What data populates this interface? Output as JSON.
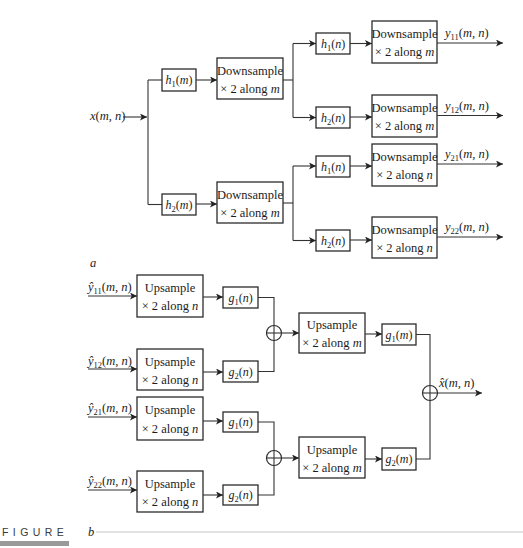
{
  "punct": {
    "open": "(",
    "close": ")"
  },
  "analysis": {
    "input": {
      "base": "x",
      "var": "m, n"
    },
    "row_filters": [
      {
        "base": "h",
        "sub": "1",
        "var": "m"
      },
      {
        "base": "h",
        "sub": "2",
        "var": "m"
      }
    ],
    "row_downsample": [
      {
        "line1": "Downsample",
        "line2": "× 2 along ",
        "var": "m"
      },
      {
        "line1": "Downsample",
        "line2": "× 2 along ",
        "var": "m"
      }
    ],
    "col_filters": [
      {
        "base": "h",
        "sub": "1",
        "var": "n"
      },
      {
        "base": "h",
        "sub": "2",
        "var": "n"
      },
      {
        "base": "h",
        "sub": "1",
        "var": "n"
      },
      {
        "base": "h",
        "sub": "2",
        "var": "n"
      }
    ],
    "col_downsample": [
      {
        "line1": "Downsample",
        "line2": "× 2 along ",
        "var": "m"
      },
      {
        "line1": "Downsample",
        "line2": "× 2 along ",
        "var": "m"
      },
      {
        "line1": "Downsample",
        "line2": "× 2 along ",
        "var": "n"
      },
      {
        "line1": "Downsample",
        "line2": "× 2 along ",
        "var": "n"
      }
    ],
    "outputs": [
      {
        "base": "y",
        "sub": "11",
        "var": "m, n"
      },
      {
        "base": "y",
        "sub": "12",
        "var": "m, n"
      },
      {
        "base": "y",
        "sub": "21",
        "var": "m, n"
      },
      {
        "base": "y",
        "sub": "22",
        "var": "m, n"
      }
    ]
  },
  "synthesis": {
    "inputs": [
      {
        "base": "ŷ",
        "sub": "11",
        "var": "m, n"
      },
      {
        "base": "ŷ",
        "sub": "12",
        "var": "m, n"
      },
      {
        "base": "ŷ",
        "sub": "21",
        "var": "m, n"
      },
      {
        "base": "ŷ",
        "sub": "22",
        "var": "m, n"
      }
    ],
    "col_upsample": [
      {
        "line1": "Upsample",
        "line2": "× 2 along ",
        "var": "n"
      },
      {
        "line1": "Upsample",
        "line2": "× 2 along ",
        "var": "n"
      },
      {
        "line1": "Upsample",
        "line2": "× 2 along ",
        "var": "n"
      },
      {
        "line1": "Upsample",
        "line2": "× 2 along ",
        "var": "n"
      }
    ],
    "col_filters": [
      {
        "base": "g",
        "sub": "1",
        "var": "n"
      },
      {
        "base": "g",
        "sub": "2",
        "var": "n"
      },
      {
        "base": "g",
        "sub": "1",
        "var": "n"
      },
      {
        "base": "g",
        "sub": "2",
        "var": "n"
      }
    ],
    "row_upsample": [
      {
        "line1": "Upsample",
        "line2": "× 2 along ",
        "var": "m"
      },
      {
        "line1": "Upsample",
        "line2": "× 2 along ",
        "var": "m"
      }
    ],
    "row_filters": [
      {
        "base": "g",
        "sub": "1",
        "var": "m"
      },
      {
        "base": "g",
        "sub": "2",
        "var": "m"
      }
    ],
    "output": {
      "base": "x̂",
      "var": "m, n"
    }
  },
  "figure": {
    "label": "FIGURE",
    "part_a": "a",
    "part_b": "b"
  }
}
